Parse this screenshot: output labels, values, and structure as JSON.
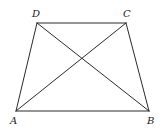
{
  "figure": {
    "type": "trapezoid-with-diagonals",
    "stroke_color": "#2a2a2a",
    "label_color": "#222222",
    "vertices": {
      "A": {
        "label": "A",
        "x": 16,
        "y": 111,
        "label_x": 10,
        "label_y": 124
      },
      "B": {
        "label": "B",
        "x": 149,
        "y": 111,
        "label_x": 147,
        "label_y": 124
      },
      "C": {
        "label": "C",
        "x": 126,
        "y": 23,
        "label_x": 123,
        "label_y": 17
      },
      "D": {
        "label": "D",
        "x": 37,
        "y": 23,
        "label_x": 32,
        "label_y": 17
      }
    },
    "sides": [
      "AB",
      "BC",
      "CD",
      "DA"
    ],
    "diagonals": [
      "AC",
      "BD"
    ]
  }
}
